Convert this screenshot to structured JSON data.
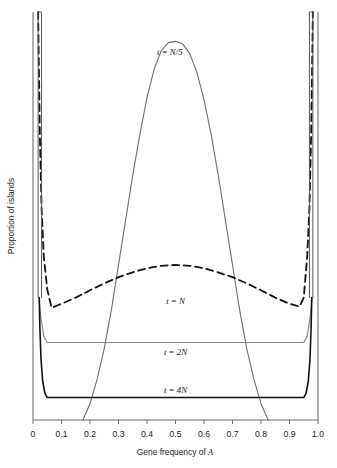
{
  "chart_data": {
    "type": "line",
    "title": "",
    "xlabel": "Gene frequency of A",
    "ylabel": "Proportion of islands",
    "xlim": [
      0,
      1.0
    ],
    "ylim": [
      0,
      1.0
    ],
    "grid": false,
    "legend_position": "inline-annotations",
    "xticks": [
      "0",
      "0.1",
      "0.2",
      "0.3",
      "0.4",
      "0.5",
      "0.6",
      "0.7",
      "0.8",
      "0.9",
      "1.0"
    ],
    "xtick_values": [
      0,
      0.1,
      0.2,
      0.3,
      0.4,
      0.5,
      0.6,
      0.7,
      0.8,
      0.9,
      1.0
    ],
    "yticks": [],
    "annotations": [
      {
        "text": "t = N/5",
        "x": 0.48,
        "y": 0.895,
        "label_id": "label-t-n-over-5"
      },
      {
        "text": "t = N",
        "x": 0.5,
        "y": 0.285,
        "label_id": "label-t-n"
      },
      {
        "text": "t = 2N",
        "x": 0.5,
        "y": 0.16,
        "label_id": "label-t-2n"
      },
      {
        "text": "t = 4N",
        "x": 0.5,
        "y": 0.065,
        "label_id": "label-t-4n"
      }
    ],
    "series": [
      {
        "name": "t = N/5",
        "style": "solid",
        "color": "#6e6e6e",
        "linewidth": 1.1,
        "description": "Narrow unimodal bell peaked at p = 0.5 reaching top of plot",
        "x": [
          0.175,
          0.2,
          0.225,
          0.25,
          0.275,
          0.3,
          0.325,
          0.35,
          0.375,
          0.4,
          0.425,
          0.45,
          0.475,
          0.5,
          0.525,
          0.55,
          0.575,
          0.6,
          0.625,
          0.65,
          0.675,
          0.7,
          0.725,
          0.75,
          0.775,
          0.8,
          0.825
        ],
        "y": [
          0.0,
          0.04,
          0.1,
          0.175,
          0.27,
          0.38,
          0.49,
          0.6,
          0.7,
          0.79,
          0.86,
          0.905,
          0.925,
          0.928,
          0.922,
          0.898,
          0.852,
          0.785,
          0.7,
          0.6,
          0.49,
          0.38,
          0.27,
          0.175,
          0.1,
          0.04,
          0.0
        ]
      },
      {
        "name": "t = N",
        "style": "dashed",
        "color": "#111111",
        "linewidth": 1.8,
        "description": "U-shaped distribution: broad low arch across interior with steep spikes at both boundaries",
        "x": [
          0.018,
          0.02,
          0.024,
          0.03,
          0.038,
          0.05,
          0.065,
          0.1,
          0.15,
          0.2,
          0.25,
          0.3,
          0.35,
          0.4,
          0.45,
          0.5,
          0.55,
          0.6,
          0.65,
          0.7,
          0.75,
          0.8,
          0.85,
          0.9,
          0.935,
          0.95,
          0.962,
          0.97,
          0.976,
          0.98,
          0.982
        ],
        "y": [
          1.0,
          0.9,
          0.7,
          0.52,
          0.4,
          0.32,
          0.275,
          0.285,
          0.3,
          0.318,
          0.335,
          0.35,
          0.362,
          0.372,
          0.378,
          0.38,
          0.378,
          0.372,
          0.362,
          0.35,
          0.335,
          0.318,
          0.3,
          0.285,
          0.278,
          0.3,
          0.4,
          0.52,
          0.7,
          0.9,
          1.0
        ]
      },
      {
        "name": "t = 2N",
        "style": "solid",
        "color": "#8a8a8a",
        "linewidth": 1.2,
        "description": "Nearly flat uniform distribution across interior with small rises at boundaries",
        "x": [
          0.02,
          0.028,
          0.038,
          0.05,
          0.5,
          0.95,
          0.962,
          0.972,
          0.98
        ],
        "y": [
          0.3,
          0.25,
          0.205,
          0.19,
          0.19,
          0.19,
          0.205,
          0.25,
          0.3
        ]
      },
      {
        "name": "t = 4N",
        "style": "solid",
        "color": "#111111",
        "linewidth": 1.6,
        "description": "Low flat distribution near zero with near-vertical spikes at both boundaries",
        "x": [
          0.022,
          0.024,
          0.028,
          0.034,
          0.042,
          0.05,
          0.5,
          0.95,
          0.958,
          0.966,
          0.972,
          0.976,
          0.978
        ],
        "y": [
          0.3,
          0.23,
          0.15,
          0.095,
          0.065,
          0.055,
          0.055,
          0.055,
          0.065,
          0.095,
          0.15,
          0.23,
          0.3
        ]
      },
      {
        "name": "boundary-spike-left",
        "style": "solid",
        "color": "#555555",
        "linewidth": 1.0,
        "description": "Vertical spike at p near 0 rising to top of plot",
        "x": [
          0.018,
          0.018,
          0.03,
          0.03
        ],
        "y": [
          0.3,
          1.0,
          1.0,
          0.3
        ]
      },
      {
        "name": "boundary-spike-right",
        "style": "solid",
        "color": "#555555",
        "linewidth": 1.0,
        "description": "Vertical spike at p near 1 rising to top of plot",
        "x": [
          0.97,
          0.97,
          0.982,
          0.982
        ],
        "y": [
          0.3,
          1.0,
          1.0,
          0.3
        ]
      }
    ]
  },
  "figure": {
    "caption_fragment": "",
    "axis": {
      "x_title": "Gene frequency of A",
      "x_title_plain": "Gene frequency of",
      "x_title_italic": "A",
      "y_title": "Proportion of islands"
    },
    "labels": {
      "t_n5": "t = N/5",
      "t_n": "t = N",
      "t_2n": "t = 2N",
      "t_4n": "t = 4N"
    }
  }
}
